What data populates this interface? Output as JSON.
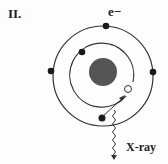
{
  "panel_label": "II.",
  "electron_label": "e−",
  "xray_label": "X-ray",
  "colors": {
    "nucleus": "#555555",
    "electron": "#1a1a1a",
    "orbit": "#333333",
    "hole_fill": "#ffffff"
  },
  "diagram": {
    "nucleus": {
      "cx": 103,
      "cy": 72,
      "r": 14
    },
    "inner_orbit": {
      "cx": 103,
      "cy": 74,
      "r": 32
    },
    "outer_orbit": {
      "cx": 103,
      "cy": 76,
      "r": 50
    },
    "electrons": [
      {
        "shell": "outer",
        "x": 106,
        "y": 26
      },
      {
        "shell": "outer",
        "x": 51,
        "y": 71
      },
      {
        "shell": "outer",
        "x": 153,
        "y": 72
      },
      {
        "shell": "outer",
        "x": 102,
        "y": 118
      },
      {
        "shell": "inner",
        "x": 82,
        "y": 52
      }
    ],
    "vacancy": {
      "shell": "inner",
      "x": 128,
      "y": 89
    },
    "transition_arrow": {
      "from": [
        102,
        118
      ],
      "to": [
        125,
        96
      ]
    }
  }
}
